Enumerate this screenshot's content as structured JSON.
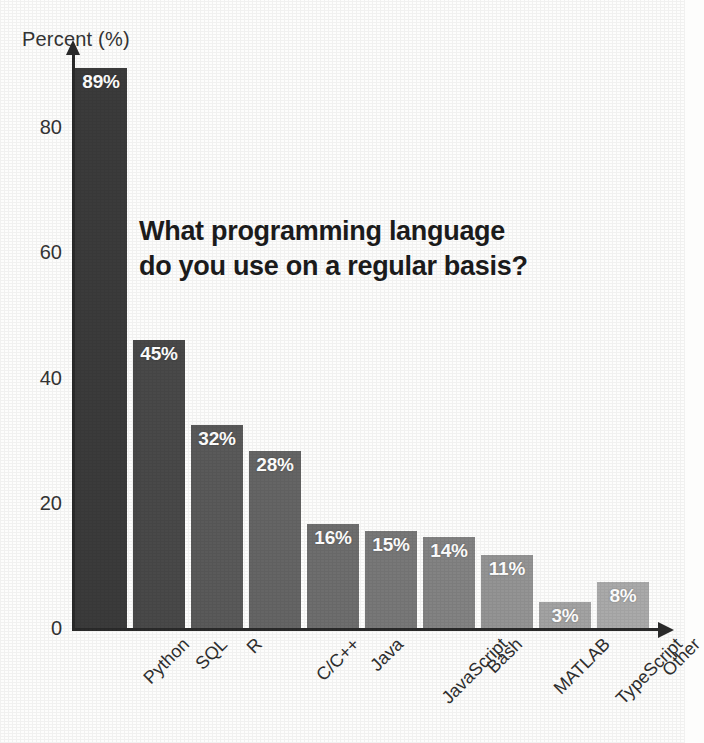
{
  "chart_data": {
    "type": "bar",
    "title": "What programming language do you use on a regular basis?",
    "title_line1": "What programming language",
    "title_line2": "do you use on a regular basis?",
    "xlabel": "",
    "ylabel": "Percent (%)",
    "ylim": [
      0,
      92
    ],
    "yticks": [
      0,
      20,
      40,
      60,
      80
    ],
    "ytick_labels": [
      "0",
      "20",
      "40",
      "60",
      "80"
    ],
    "grid": false,
    "legend": "none",
    "categories": [
      "Python",
      "SQL",
      "R",
      "C/C++",
      "Java",
      "JavaScript",
      "Bash",
      "MATLAB",
      "TypeScript",
      "Other"
    ],
    "values": [
      89,
      45,
      32,
      28,
      16,
      15,
      14,
      11,
      3,
      8
    ],
    "value_labels": [
      "89%",
      "45%",
      "32%",
      "28%",
      "16%",
      "15%",
      "14%",
      "11%",
      "3%",
      "8%"
    ],
    "bar_colors": [
      "#3b3b3b",
      "#494949",
      "#5a5a5a",
      "#656565",
      "#6e6e6e",
      "#787878",
      "#838383",
      "#949494",
      "#a3a3a3",
      "#aaaaaa"
    ],
    "bar_drawn_heights_px": [
      560,
      288,
      203,
      177,
      104,
      97,
      91,
      73,
      26,
      46
    ],
    "bar_width_px": 52,
    "bar_gap_px": 6
  },
  "axis": {
    "y_title": "Percent (%)",
    "y_arrow_icon": "arrow-up-icon",
    "x_arrow_icon": "arrow-right-icon"
  }
}
